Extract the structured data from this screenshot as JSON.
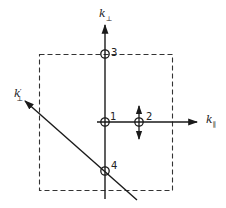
{
  "diagram": {
    "colors": {
      "ink": "#1a1a1a",
      "dashed_box": "#333333",
      "background": "#ffffff"
    },
    "axes": {
      "k_perp": {
        "base": "k",
        "subscript": "⊥",
        "prime": ""
      },
      "k_par": {
        "base": "k",
        "subscript": "∥",
        "prime": ""
      },
      "k_perp_prime": {
        "base": "k",
        "subscript": "⊥",
        "prime": "′"
      }
    },
    "points": [
      {
        "id": "1",
        "label": "1"
      },
      {
        "id": "2",
        "label": "2"
      },
      {
        "id": "3",
        "label": "3"
      },
      {
        "id": "4",
        "label": "4"
      }
    ],
    "dashed_box": {
      "style": "dashed"
    }
  }
}
